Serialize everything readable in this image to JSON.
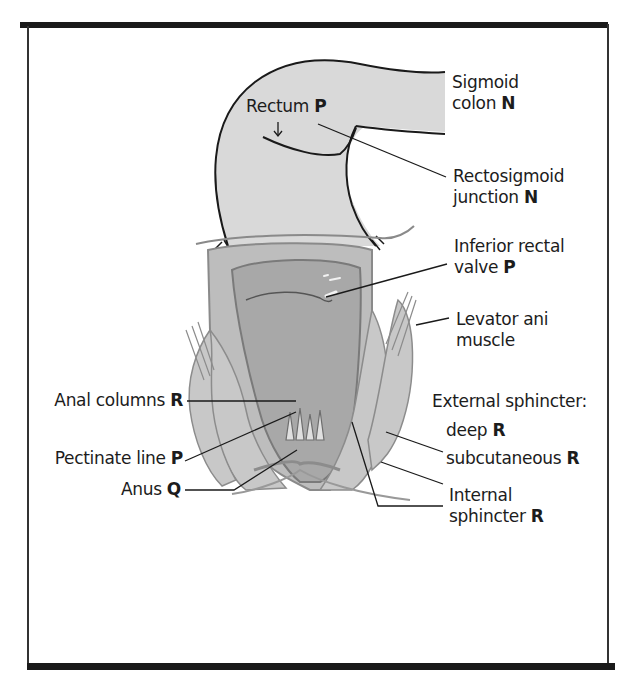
{
  "figure": {
    "labels": {
      "rectum": {
        "text": "Rectum",
        "code": "P"
      },
      "sigmoid_colon": {
        "line1": "Sigmoid",
        "line2": "colon",
        "code": "N"
      },
      "rectosigmoid_junction": {
        "line1": "Rectosigmoid",
        "line2": "junction",
        "code": "N"
      },
      "inferior_rectal_valve": {
        "line1": "Inferior rectal",
        "line2": "valve",
        "code": "P"
      },
      "levator_ani": {
        "line1": "Levator ani",
        "line2": "muscle"
      },
      "anal_columns": {
        "text": "Anal columns",
        "code": "R"
      },
      "external_sphincter": {
        "text": "External sphincter:"
      },
      "deep": {
        "text": "deep",
        "code": "R"
      },
      "pectinate_line": {
        "text": "Pectinate line",
        "code": "P"
      },
      "subcutaneous": {
        "text": "subcutaneous",
        "code": "R"
      },
      "anus": {
        "text": "Anus",
        "code": "Q"
      },
      "internal_sphincter": {
        "line1": "Internal",
        "line2": "sphincter",
        "code": "R"
      }
    },
    "colors": {
      "colon_fill": "#d9d9d9",
      "rectum_fill": "#a8a8a8",
      "wall_fill": "#bdbdbd",
      "outline": "#1a1a1a",
      "muscle": "#8c8c8c"
    }
  }
}
